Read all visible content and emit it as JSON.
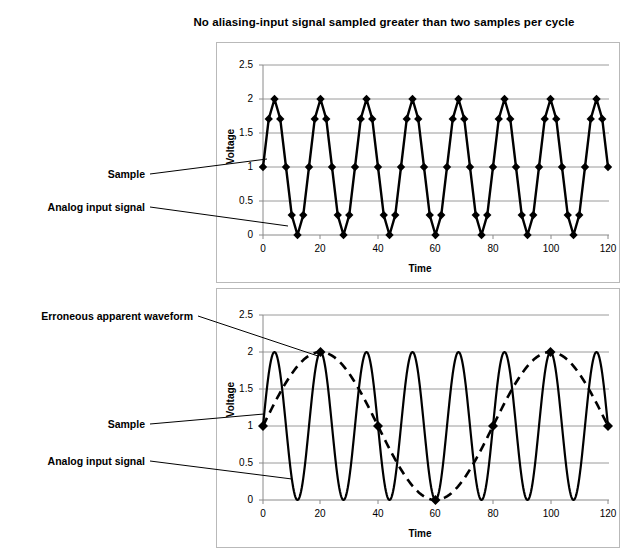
{
  "figure": {
    "title": "No aliasing-input signal sampled greater than two samples per cycle"
  },
  "annotations": {
    "top": [
      {
        "id": "sample",
        "label": "Sample"
      },
      {
        "id": "analog",
        "label": "Analog input signal"
      }
    ],
    "bottom": [
      {
        "id": "erroneous",
        "label": "Erroneous apparent waveform"
      },
      {
        "id": "sample",
        "label": "Sample"
      },
      {
        "id": "analog",
        "label": "Analog input signal"
      }
    ]
  },
  "chart_data": [
    {
      "id": "chart-top",
      "type": "line",
      "title": "",
      "xlabel": "Time",
      "ylabel": "Voltage",
      "xlim": [
        0,
        120
      ],
      "ylim": [
        0,
        2.5
      ],
      "xticks": [
        0,
        20,
        40,
        60,
        80,
        100,
        120
      ],
      "yticks": [
        0,
        0.5,
        1,
        1.5,
        2,
        2.5
      ],
      "grid": "horizontal",
      "legend": "none",
      "series": [
        {
          "name": "Analog input signal / Sample",
          "style": "solid-with-diamond-markers",
          "marker": "diamond",
          "period": 16,
          "amplitude": 1,
          "offset": 1,
          "sample_interval": 2,
          "x": [
            0,
            2,
            4,
            6,
            8,
            10,
            12,
            14,
            16,
            18,
            20,
            22,
            24,
            26,
            28,
            30,
            32,
            34,
            36,
            38,
            40,
            42,
            44,
            46,
            48,
            50,
            52,
            54,
            56,
            58,
            60,
            62,
            64,
            66,
            68,
            70,
            72,
            74,
            76,
            78,
            80,
            82,
            84,
            86,
            88,
            90,
            92,
            94,
            96,
            98,
            100,
            102,
            104,
            106,
            108,
            110,
            112,
            114,
            116,
            118,
            120
          ],
          "y": [
            1,
            1.707,
            2,
            1.707,
            1,
            0.293,
            0,
            0.293,
            1,
            1.707,
            2,
            1.707,
            1,
            0.293,
            0,
            0.293,
            1,
            1.707,
            2,
            1.707,
            1,
            0.293,
            0,
            0.293,
            1,
            1.707,
            2,
            1.707,
            1,
            0.293,
            0,
            0.293,
            1,
            1.707,
            2,
            1.707,
            1,
            0.293,
            0,
            0.293,
            1,
            1.707,
            2,
            1.707,
            1,
            0.293,
            0,
            0.293,
            1,
            1.707,
            2,
            1.707,
            1,
            0.293,
            0,
            0.293,
            1,
            1.707,
            2,
            1.707,
            1
          ]
        }
      ]
    },
    {
      "id": "chart-bottom",
      "type": "line",
      "title": "",
      "xlabel": "Time",
      "ylabel": "Voltage",
      "xlim": [
        0,
        120
      ],
      "ylim": [
        0,
        2.5
      ],
      "xticks": [
        0,
        20,
        40,
        60,
        80,
        100,
        120
      ],
      "yticks": [
        0,
        0.5,
        1,
        1.5,
        2,
        2.5
      ],
      "grid": "horizontal",
      "legend": "none",
      "series": [
        {
          "name": "Analog input signal",
          "style": "solid",
          "marker": "none",
          "period": 16,
          "amplitude": 1,
          "offset": 1
        },
        {
          "name": "Erroneous apparent waveform",
          "style": "dashed-with-diamond-markers",
          "marker": "diamond",
          "period": 80,
          "amplitude": 1,
          "offset": 1,
          "sample_interval": 20,
          "x": [
            0,
            20,
            40,
            60,
            80,
            100,
            120
          ],
          "y": [
            1,
            2,
            1,
            0,
            1,
            2,
            1
          ]
        }
      ]
    }
  ]
}
